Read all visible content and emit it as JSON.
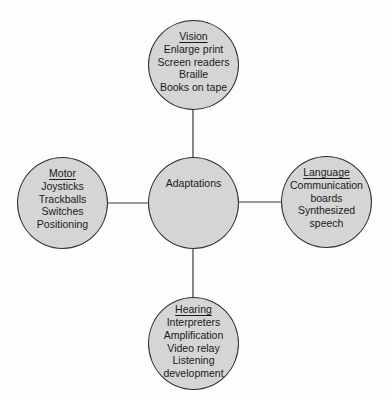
{
  "diagram": {
    "colors": {
      "node_fill": "#d5d5d5",
      "node_border": "#2e2e2e",
      "connector": "#3a3a3a",
      "background": "#fdfdfd"
    },
    "center": {
      "label": "Adaptations"
    },
    "nodes": {
      "vision": {
        "title": "Vision",
        "items": [
          "Enlarge print",
          "Screen readers",
          "Braille",
          "Books on tape"
        ]
      },
      "motor": {
        "title": "Motor",
        "items": [
          "Joysticks",
          "Trackballs",
          "Switches",
          "Positioning"
        ]
      },
      "language": {
        "title": "Language",
        "items": [
          "Communication",
          "boards",
          "Synthesized",
          "speech"
        ]
      },
      "hearing": {
        "title": "Hearing",
        "items": [
          "Interpreters",
          "Amplification",
          "Video relay",
          "Listening",
          "development"
        ]
      }
    }
  }
}
